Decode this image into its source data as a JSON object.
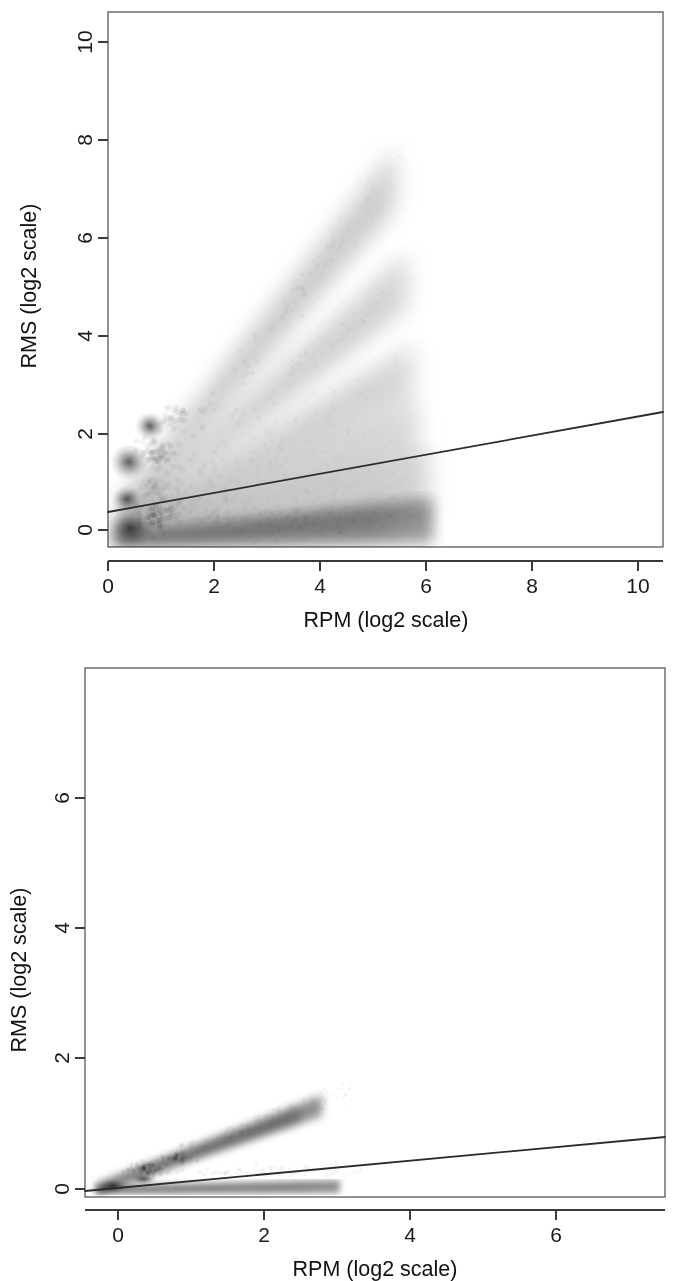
{
  "figure": {
    "background_color": "#ffffff",
    "ink_color": "#1a1a1a",
    "panel_count": 2
  },
  "chart_data": [
    {
      "panel_id": "top",
      "type": "scatter",
      "render_style": "alpha-blended density scatter (greyscale)",
      "title": "",
      "subtitle": "",
      "xlabel": "RPM (log2 scale)",
      "ylabel": "RMS (log2 scale)",
      "xlim": [
        -0.55,
        10.7
      ],
      "ylim": [
        -0.62,
        10.75
      ],
      "xticks": [
        0,
        2,
        4,
        6,
        8,
        10
      ],
      "xticklabels": [
        "0",
        "2",
        "4",
        "6",
        "8",
        "10"
      ],
      "yticks": [
        0,
        2,
        4,
        6,
        8,
        10
      ],
      "yticklabels": [
        "0",
        "2",
        "4",
        "6",
        "8",
        "10"
      ],
      "grid": false,
      "legend": false,
      "point_color": "#000000",
      "point_alpha_low": 0.04,
      "data_extent": {
        "x_min": 0.1,
        "x_max": 6.2,
        "y_min": -0.3,
        "y_max": 7.6
      },
      "density_rays": [
        {
          "name": "ray-1-steepest",
          "slope": 1.42,
          "intercept": 0.12,
          "x_start": 0.15,
          "x_end": 5.4,
          "peak_y": 7.55,
          "weight": 0.78,
          "spread": 0.34
        },
        {
          "name": "ray-2",
          "slope": 0.95,
          "intercept": 0.05,
          "x_start": 0.2,
          "x_end": 5.6,
          "peak_y": 5.2,
          "weight": 0.66,
          "spread": 0.32
        },
        {
          "name": "ray-3",
          "slope": 0.62,
          "intercept": 0.02,
          "x_start": 0.2,
          "x_end": 5.7,
          "peak_y": 3.5,
          "weight": 0.58,
          "spread": 0.3
        },
        {
          "name": "ray-4",
          "slope": 0.4,
          "intercept": 0.0,
          "x_start": 0.2,
          "x_end": 5.8,
          "peak_y": 2.3,
          "weight": 0.5,
          "spread": 0.3
        },
        {
          "name": "ray-5-shallow-bulk",
          "slope": 0.18,
          "intercept": 0.0,
          "x_start": 0.15,
          "x_end": 6.1,
          "peak_y": 1.1,
          "weight": 0.62,
          "spread": 0.45
        },
        {
          "name": "ray-6-floor",
          "slope": 0.02,
          "intercept": -0.02,
          "x_start": 0.15,
          "x_end": 6.2,
          "peak_y": 0.1,
          "weight": 0.88,
          "spread": 0.28
        }
      ],
      "density_blobs": [
        {
          "name": "blob-origin-core",
          "x": 0.42,
          "y": 0.02,
          "rx": 0.38,
          "ry": 0.3,
          "weight": 0.95
        },
        {
          "name": "blob-mid-left",
          "x": 0.4,
          "y": 1.38,
          "rx": 0.3,
          "ry": 0.3,
          "weight": 0.82
        },
        {
          "name": "blob-upper-left",
          "x": 0.82,
          "y": 2.12,
          "rx": 0.26,
          "ry": 0.24,
          "weight": 0.6
        },
        {
          "name": "blob-low-left",
          "x": 0.35,
          "y": 0.62,
          "rx": 0.26,
          "ry": 0.22,
          "weight": 0.55
        }
      ],
      "fit_line": {
        "name": "regression-line",
        "slope": 0.1865,
        "intercept": 0.305,
        "x_from": -0.55,
        "x_to": 10.7,
        "y_from": 0.2,
        "y_to": 2.3,
        "color": "#2b2b2b"
      }
    },
    {
      "panel_id": "bottom",
      "type": "scatter",
      "render_style": "alpha-blended density scatter (greyscale)",
      "title": "",
      "subtitle": "",
      "xlabel": "RPM (log2 scale)",
      "ylabel": "RMS (log2 scale)",
      "xlim": [
        -0.45,
        7.5
      ],
      "ylim": [
        -0.35,
        7.45
      ],
      "xticks": [
        0,
        2,
        4,
        6
      ],
      "xticklabels": [
        "0",
        "2",
        "4",
        "6"
      ],
      "yticks": [
        0,
        2,
        4,
        6
      ],
      "yticklabels": [
        "0",
        "2",
        "4",
        "6"
      ],
      "grid": false,
      "legend": false,
      "point_color": "#000000",
      "point_alpha_low": 0.05,
      "data_extent": {
        "x_min": 0.15,
        "x_max": 3.4,
        "y_min": -0.05,
        "y_max": 1.25
      },
      "density_rays": [
        {
          "name": "ray-main-upper",
          "slope": 0.4,
          "intercept": -0.02,
          "x_start": 0.18,
          "x_end": 3.2,
          "peak_y": 1.25,
          "weight": 0.8,
          "spread": 0.1
        },
        {
          "name": "ray-floor",
          "slope": 0.012,
          "intercept": 0.0,
          "x_start": 0.18,
          "x_end": 3.4,
          "peak_y": 0.05,
          "weight": 0.72,
          "spread": 0.06
        }
      ],
      "density_blobs": [
        {
          "name": "blob-origin-core",
          "x": 0.38,
          "y": 0.06,
          "rx": 0.22,
          "ry": 0.09,
          "weight": 0.88
        },
        {
          "name": "blob-second",
          "x": 0.78,
          "y": 0.22,
          "rx": 0.2,
          "ry": 0.08,
          "weight": 0.7
        }
      ],
      "fit_line": {
        "name": "regression-line",
        "slope": 0.0935,
        "intercept": 0.0375,
        "x_from": -0.45,
        "x_to": 7.5,
        "y_from": -0.005,
        "y_to": 0.74,
        "color": "#2b2b2b"
      }
    }
  ]
}
